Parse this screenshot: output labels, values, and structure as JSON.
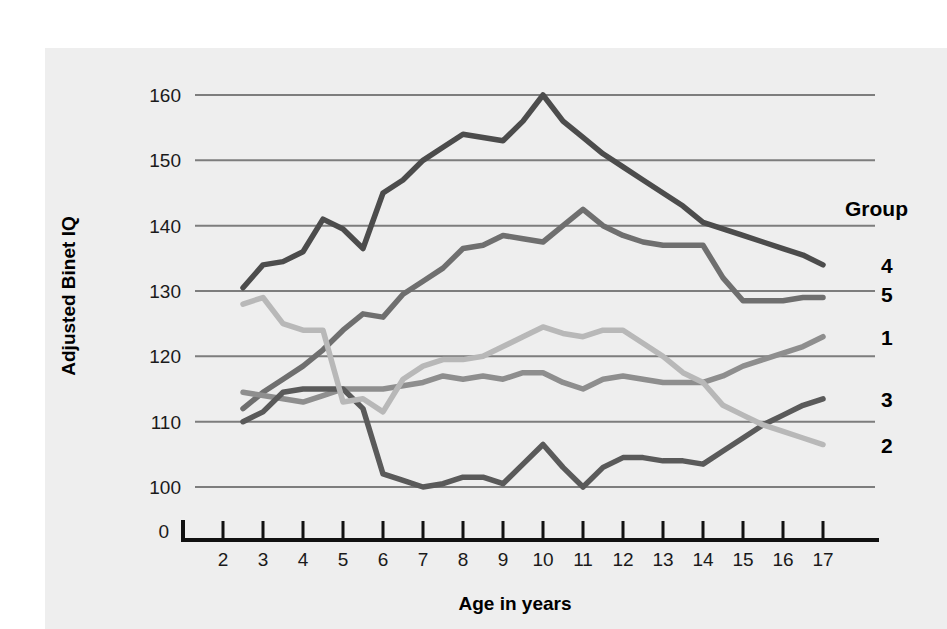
{
  "chart_data": {
    "type": "line",
    "title": "",
    "xlabel": "Age in years",
    "ylabel": "Adjusted Binet IQ",
    "xlim": [
      2,
      17
    ],
    "ylim": [
      95,
      163
    ],
    "grid": true,
    "y_ticks": [
      100,
      110,
      120,
      130,
      140,
      150,
      160
    ],
    "y_tick_labels": [
      "100",
      "110",
      "120",
      "130",
      "140",
      "150",
      "160"
    ],
    "y_origin_label": "0",
    "x_ticks": [
      2,
      3,
      4,
      5,
      6,
      7,
      8,
      9,
      10,
      11,
      12,
      13,
      14,
      15,
      16,
      17
    ],
    "x_tick_labels": [
      "2",
      "3",
      "4",
      "5",
      "6",
      "7",
      "8",
      "9",
      "10",
      "11",
      "12",
      "13",
      "14",
      "15",
      "16",
      "17"
    ],
    "legend_title": "Group",
    "legend_position": "right",
    "legend_order": [
      "4",
      "5",
      "1",
      "3",
      "2"
    ],
    "series": [
      {
        "name": "4",
        "label": "4",
        "color": "#4c4c4c",
        "legend_label_y": 134.0,
        "x": [
          2.5,
          3,
          3.5,
          4,
          4.5,
          5,
          5.5,
          6,
          6.5,
          7,
          7.5,
          8,
          8.5,
          9,
          9.5,
          10,
          10.5,
          11,
          11.5,
          12,
          12.5,
          13,
          13.5,
          14,
          14.5,
          15,
          15.5,
          16,
          16.5,
          17
        ],
        "values": [
          130.5,
          134.0,
          134.5,
          136.0,
          141.0,
          139.5,
          136.5,
          145.0,
          147.0,
          150.0,
          152.0,
          154.0,
          153.5,
          153.0,
          156.0,
          160.0,
          156.0,
          153.5,
          151.0,
          149.0,
          147.0,
          145.0,
          143.0,
          140.5,
          139.5,
          138.5,
          137.5,
          136.5,
          135.5,
          134.0
        ]
      },
      {
        "name": "5",
        "label": "5",
        "color": "#6f6f6f",
        "legend_label_y": 129.5,
        "x": [
          2.5,
          3,
          3.5,
          4,
          4.5,
          5,
          5.5,
          6,
          6.5,
          7,
          7.5,
          8,
          8.5,
          9,
          9.5,
          10,
          10.5,
          11,
          11.5,
          12,
          12.5,
          13,
          13.5,
          14,
          14.5,
          15,
          15.5,
          16,
          16.5,
          17
        ],
        "values": [
          112.0,
          114.5,
          116.5,
          118.5,
          121.0,
          124.0,
          126.5,
          126.0,
          129.5,
          131.5,
          133.5,
          136.5,
          137.0,
          138.5,
          138.0,
          137.5,
          140.0,
          142.5,
          140.0,
          138.5,
          137.5,
          137.0,
          137.0,
          137.0,
          132.0,
          128.5,
          128.5,
          128.5,
          129.0,
          129.0
        ]
      },
      {
        "name": "1",
        "label": "1",
        "color": "#8e8e8e",
        "legend_label_y": 123.0,
        "x": [
          2.5,
          3,
          3.5,
          4,
          4.5,
          5,
          5.5,
          6,
          6.5,
          7,
          7.5,
          8,
          8.5,
          9,
          9.5,
          10,
          10.5,
          11,
          11.5,
          12,
          12.5,
          13,
          13.5,
          14,
          14.5,
          15,
          15.5,
          16,
          16.5,
          17
        ],
        "values": [
          114.5,
          114.0,
          113.5,
          113.0,
          114.0,
          115.0,
          115.0,
          115.0,
          115.5,
          116.0,
          117.0,
          116.5,
          117.0,
          116.5,
          117.5,
          117.5,
          116.0,
          115.0,
          116.5,
          117.0,
          116.5,
          116.0,
          116.0,
          116.0,
          117.0,
          118.5,
          119.5,
          120.5,
          121.5,
          123.0
        ]
      },
      {
        "name": "3",
        "label": "3",
        "color": "#5a5a5a",
        "legend_label_y": 113.5,
        "x": [
          2.5,
          3,
          3.5,
          4,
          4.5,
          5,
          5.5,
          6,
          6.5,
          7,
          7.5,
          8,
          8.5,
          9,
          9.5,
          10,
          10.5,
          11,
          11.5,
          12,
          12.5,
          13,
          13.5,
          14,
          14.5,
          15,
          15.5,
          16,
          16.5,
          17
        ],
        "values": [
          110.0,
          111.5,
          114.5,
          115.0,
          115.0,
          115.0,
          112.0,
          102.0,
          101.0,
          100.0,
          100.5,
          101.5,
          101.5,
          100.5,
          103.5,
          106.5,
          103.0,
          100.0,
          103.0,
          104.5,
          104.5,
          104.0,
          104.0,
          103.5,
          105.5,
          107.5,
          109.5,
          111.0,
          112.5,
          113.5
        ]
      },
      {
        "name": "2",
        "label": "2",
        "color": "#b8b8b8",
        "legend_label_y": 106.5,
        "x": [
          2.5,
          3,
          3.5,
          4,
          4.5,
          5,
          5.5,
          6,
          6.5,
          7,
          7.5,
          8,
          8.5,
          9,
          9.5,
          10,
          10.5,
          11,
          11.5,
          12,
          12.5,
          13,
          13.5,
          14,
          14.5,
          15,
          15.5,
          16,
          16.5,
          17
        ],
        "values": [
          128.0,
          129.0,
          125.0,
          124.0,
          124.0,
          113.0,
          113.5,
          111.5,
          116.5,
          118.5,
          119.5,
          119.5,
          120.0,
          121.5,
          123.0,
          124.5,
          123.5,
          123.0,
          124.0,
          124.0,
          122.0,
          120.0,
          117.5,
          116.0,
          112.5,
          111.0,
          109.5,
          108.5,
          107.5,
          106.5
        ]
      }
    ]
  },
  "colors": {
    "panel_background": "#eeeeee",
    "page_background": "#ffffff",
    "gridline": "#7d7d7d",
    "axis": "#111111",
    "text": "#000000"
  }
}
